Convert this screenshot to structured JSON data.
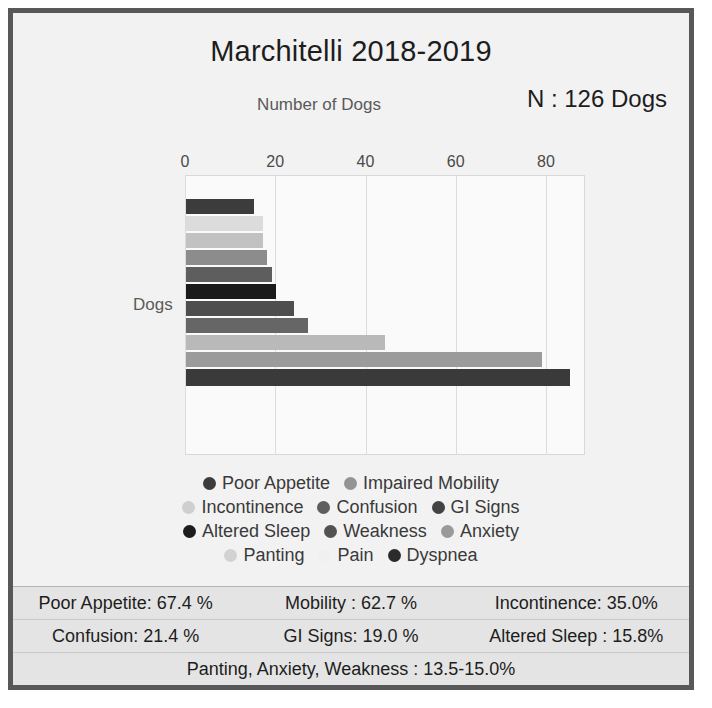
{
  "figure": {
    "title": "Marchitelli 2018-2019",
    "n_label": "N : 126 Dogs",
    "xaxis_title": "Number of Dogs",
    "yaxis_label": "Dogs",
    "border_color": "#58585a",
    "background_color": "#f2f2f2"
  },
  "chart_data": {
    "type": "bar",
    "orientation": "horizontal",
    "title": "Marchitelli 2018-2019",
    "xlabel": "Number of Dogs",
    "ylabel": "Dogs",
    "xlim": [
      0,
      88
    ],
    "ticks": [
      0,
      20,
      40,
      60,
      80
    ],
    "tick_labels": [
      "0",
      "20",
      "40",
      "60",
      "80"
    ],
    "grid": true,
    "legend_position": "bottom",
    "total_n": 126,
    "categories": [
      "Poor Appetite",
      "Impaired Mobility",
      "Incontinence",
      "Confusion",
      "GI Signs",
      "Altered Sleep",
      "Weakness",
      "Anxiety",
      "Panting",
      "Pain",
      "Dyspnea"
    ],
    "values": [
      85,
      79,
      44,
      27,
      24,
      20,
      19,
      18,
      17,
      17,
      15
    ],
    "percents": [
      67.4,
      62.7,
      35.0,
      21.4,
      19.0,
      15.8,
      15.0,
      14.3,
      13.5,
      13.5,
      11.9
    ],
    "colors": [
      "#3c3c3c",
      "#8e8e8e",
      "#d3d3d3",
      "#686868",
      "#4a4a4a",
      "#1a1a1a",
      "#5a5a5a",
      "#7e7e7e",
      "#b0b0b0",
      "#e8e8e8",
      "#2e2e2e"
    ],
    "bar_order_top_to_bottom": [
      "Dyspnea",
      "Pain",
      "Panting",
      "Anxiety",
      "Weakness",
      "Altered Sleep",
      "GI Signs",
      "Confusion",
      "Incontinence",
      "Impaired Mobility",
      "Poor Appetite"
    ]
  },
  "legend": {
    "rows": [
      [
        {
          "label": "Poor Appetite",
          "color": "#3c3c3c"
        },
        {
          "label": "Impaired Mobility",
          "color": "#949494"
        }
      ],
      [
        {
          "label": "Incontinence",
          "color": "#cfcfcf"
        },
        {
          "label": "Confusion",
          "color": "#5e5e5e"
        },
        {
          "label": "GI Signs",
          "color": "#434343"
        }
      ],
      [
        {
          "label": "Altered Sleep",
          "color": "#1c1c1c"
        },
        {
          "label": "Weakness",
          "color": "#525252"
        },
        {
          "label": "Anxiety",
          "color": "#9a9a9a"
        }
      ],
      [
        {
          "label": "Panting",
          "color": "#d2d2d2"
        },
        {
          "label": "Pain",
          "color": "#f0f0f0"
        },
        {
          "label": "Dyspnea",
          "color": "#2b2b2b"
        }
      ]
    ]
  },
  "stats": {
    "rows": [
      [
        "Poor Appetite: 67.4 %",
        "Mobility : 62.7 %",
        "Incontinence: 35.0%"
      ],
      [
        "Confusion: 21.4 %",
        "GI Signs: 19.0 %",
        "Altered Sleep : 15.8%"
      ],
      [
        "Panting, Anxiety, Weakness : 13.5-15.0%"
      ]
    ]
  },
  "bars": [
    {
      "label": "Dyspnea",
      "value": 15,
      "color": "#3c3c3c",
      "top": 0,
      "h": 15
    },
    {
      "label": "Pain",
      "value": 17,
      "color": "#dcdcdc",
      "top": 17,
      "h": 15
    },
    {
      "label": "Panting",
      "value": 17,
      "color": "#c2c2c2",
      "top": 34,
      "h": 15
    },
    {
      "label": "Anxiety",
      "value": 18,
      "color": "#8c8c8c",
      "top": 51,
      "h": 15
    },
    {
      "label": "Weakness",
      "value": 19,
      "color": "#5e5e5e",
      "top": 68,
      "h": 15
    },
    {
      "label": "Altered Sleep",
      "value": 20,
      "color": "#1a1a1a",
      "top": 85,
      "h": 15
    },
    {
      "label": "GI Signs",
      "value": 24,
      "color": "#4e4e4e",
      "top": 102,
      "h": 15
    },
    {
      "label": "Confusion",
      "value": 27,
      "color": "#666666",
      "top": 119,
      "h": 15
    },
    {
      "label": "Incontinence",
      "value": 44,
      "color": "#b9b9b9",
      "top": 136,
      "h": 15
    },
    {
      "label": "Impaired Mobility",
      "value": 79,
      "color": "#9b9b9b",
      "top": 153,
      "h": 15
    },
    {
      "label": "Poor Appetite",
      "value": 85,
      "color": "#3a3a3a",
      "top": 170,
      "h": 17
    }
  ]
}
